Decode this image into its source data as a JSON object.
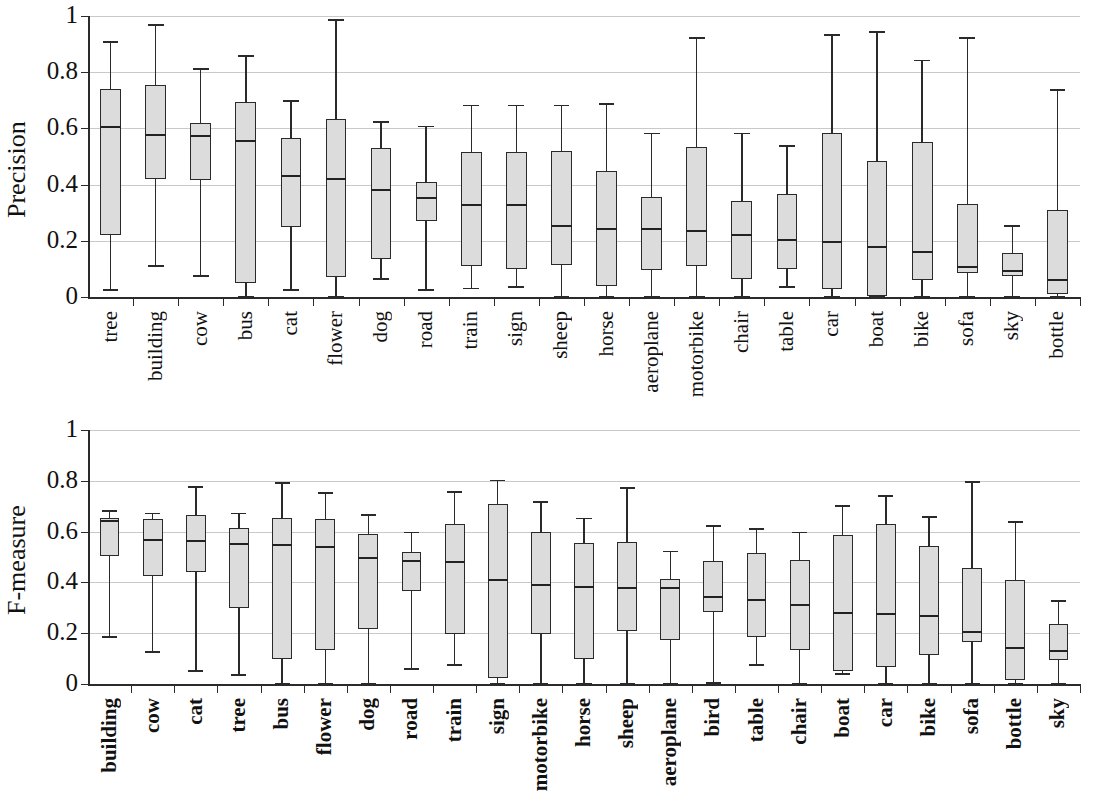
{
  "figure": {
    "background": "#ffffff",
    "box_fill": "#dcdcdc",
    "line_color": "#2a2a2a",
    "grid_color": "#c9c9c9"
  },
  "chart_data": [
    {
      "type": "box",
      "title": "",
      "ylabel": "Precision",
      "xlabel": "",
      "ylim": [
        0,
        1
      ],
      "yticks": [
        "0",
        "0.2",
        "0.4",
        "0.6",
        "0.8",
        "1"
      ],
      "ytick_values": [
        0,
        0.2,
        0.4,
        0.6,
        0.8,
        1
      ],
      "grid": "horizontal",
      "legend": "none",
      "categories": [
        "tree",
        "building",
        "cow",
        "bus",
        "cat",
        "flower",
        "dog",
        "road",
        "train",
        "sign",
        "sheep",
        "horse",
        "aeroplane",
        "motorbike",
        "chair",
        "table",
        "car",
        "boat",
        "bike",
        "sofa",
        "sky",
        "bottle"
      ],
      "boxes": [
        {
          "label": "tree",
          "min": 0.025,
          "q1": 0.22,
          "median": 0.61,
          "q3": 0.74,
          "max": 0.91
        },
        {
          "label": "building",
          "min": 0.11,
          "q1": 0.42,
          "median": 0.58,
          "q3": 0.755,
          "max": 0.97
        },
        {
          "label": "cow",
          "min": 0.075,
          "q1": 0.415,
          "median": 0.575,
          "q3": 0.62,
          "max": 0.815
        },
        {
          "label": "bus",
          "min": 0.0,
          "q1": 0.05,
          "median": 0.56,
          "q3": 0.695,
          "max": 0.86
        },
        {
          "label": "cat",
          "min": 0.025,
          "q1": 0.25,
          "median": 0.435,
          "q3": 0.565,
          "max": 0.7
        },
        {
          "label": "flower",
          "min": 0.0,
          "q1": 0.07,
          "median": 0.425,
          "q3": 0.635,
          "max": 0.99
        },
        {
          "label": "dog",
          "min": 0.065,
          "q1": 0.135,
          "median": 0.385,
          "q3": 0.53,
          "max": 0.625
        },
        {
          "label": "road",
          "min": 0.025,
          "q1": 0.27,
          "median": 0.355,
          "q3": 0.41,
          "max": 0.61
        },
        {
          "label": "train",
          "min": 0.03,
          "q1": 0.11,
          "median": 0.33,
          "q3": 0.515,
          "max": 0.685
        },
        {
          "label": "sign",
          "min": 0.035,
          "q1": 0.1,
          "median": 0.33,
          "q3": 0.515,
          "max": 0.685
        },
        {
          "label": "sheep",
          "min": 0.0,
          "q1": 0.115,
          "median": 0.255,
          "q3": 0.52,
          "max": 0.685
        },
        {
          "label": "horse",
          "min": 0.0,
          "q1": 0.04,
          "median": 0.245,
          "q3": 0.45,
          "max": 0.69
        },
        {
          "label": "aeroplane",
          "min": 0.0,
          "q1": 0.095,
          "median": 0.245,
          "q3": 0.355,
          "max": 0.585
        },
        {
          "label": "motorbike",
          "min": 0.0,
          "q1": 0.11,
          "median": 0.24,
          "q3": 0.535,
          "max": 0.925
        },
        {
          "label": "chair",
          "min": 0.0,
          "q1": 0.065,
          "median": 0.225,
          "q3": 0.34,
          "max": 0.585
        },
        {
          "label": "table",
          "min": 0.035,
          "q1": 0.1,
          "median": 0.205,
          "q3": 0.365,
          "max": 0.54
        },
        {
          "label": "car",
          "min": 0.0,
          "q1": 0.03,
          "median": 0.2,
          "q3": 0.585,
          "max": 0.935
        },
        {
          "label": "boat",
          "min": 0.0,
          "q1": 0.005,
          "median": 0.18,
          "q3": 0.485,
          "max": 0.945
        },
        {
          "label": "bike",
          "min": 0.0,
          "q1": 0.06,
          "median": 0.165,
          "q3": 0.55,
          "max": 0.845
        },
        {
          "label": "sofa",
          "min": 0.0,
          "q1": 0.085,
          "median": 0.11,
          "q3": 0.33,
          "max": 0.925
        },
        {
          "label": "sky",
          "min": 0.0,
          "q1": 0.075,
          "median": 0.095,
          "q3": 0.155,
          "max": 0.255
        },
        {
          "label": "bottle",
          "min": 0.0,
          "q1": 0.01,
          "median": 0.065,
          "q3": 0.31,
          "max": 0.74
        }
      ]
    },
    {
      "type": "box",
      "title": "",
      "ylabel": "F-measure",
      "xlabel": "",
      "ylim": [
        0,
        1
      ],
      "yticks": [
        "0",
        "0.2",
        "0.4",
        "0.6",
        "0.8",
        "1"
      ],
      "ytick_values": [
        0,
        0.2,
        0.4,
        0.6,
        0.8,
        1
      ],
      "grid": "horizontal",
      "legend": "none",
      "categories": [
        "building",
        "cow",
        "cat",
        "tree",
        "bus",
        "flower",
        "dog",
        "road",
        "train",
        "sign",
        "motorbike",
        "horse",
        "sheep",
        "aeroplane",
        "bird",
        "table",
        "chair",
        "boat",
        "car",
        "bike",
        "sofa",
        "bottle",
        "sky"
      ],
      "boxes": [
        {
          "label": "building",
          "min": 0.185,
          "q1": 0.505,
          "median": 0.645,
          "q3": 0.655,
          "max": 0.685
        },
        {
          "label": "cow",
          "min": 0.125,
          "q1": 0.425,
          "median": 0.57,
          "q3": 0.65,
          "max": 0.675
        },
        {
          "label": "cat",
          "min": 0.05,
          "q1": 0.44,
          "median": 0.565,
          "q3": 0.665,
          "max": 0.78
        },
        {
          "label": "tree",
          "min": 0.035,
          "q1": 0.3,
          "median": 0.555,
          "q3": 0.615,
          "max": 0.675
        },
        {
          "label": "bus",
          "min": 0.0,
          "q1": 0.1,
          "median": 0.55,
          "q3": 0.655,
          "max": 0.795
        },
        {
          "label": "flower",
          "min": 0.0,
          "q1": 0.135,
          "median": 0.545,
          "q3": 0.65,
          "max": 0.755
        },
        {
          "label": "dog",
          "min": 0.0,
          "q1": 0.215,
          "median": 0.5,
          "q3": 0.59,
          "max": 0.67
        },
        {
          "label": "road",
          "min": 0.06,
          "q1": 0.365,
          "median": 0.49,
          "q3": 0.52,
          "max": 0.6
        },
        {
          "label": "train",
          "min": 0.075,
          "q1": 0.195,
          "median": 0.485,
          "q3": 0.63,
          "max": 0.76
        },
        {
          "label": "sign",
          "min": 0.0,
          "q1": 0.025,
          "median": 0.415,
          "q3": 0.71,
          "max": 0.805
        },
        {
          "label": "motorbike",
          "min": 0.0,
          "q1": 0.195,
          "median": 0.395,
          "q3": 0.6,
          "max": 0.72
        },
        {
          "label": "horse",
          "min": 0.0,
          "q1": 0.1,
          "median": 0.385,
          "q3": 0.555,
          "max": 0.655
        },
        {
          "label": "sheep",
          "min": 0.0,
          "q1": 0.21,
          "median": 0.38,
          "q3": 0.56,
          "max": 0.775
        },
        {
          "label": "aeroplane",
          "min": 0.0,
          "q1": 0.175,
          "median": 0.38,
          "q3": 0.415,
          "max": 0.525
        },
        {
          "label": "bird",
          "min": 0.005,
          "q1": 0.285,
          "median": 0.345,
          "q3": 0.485,
          "max": 0.625
        },
        {
          "label": "table",
          "min": 0.075,
          "q1": 0.185,
          "median": 0.335,
          "q3": 0.515,
          "max": 0.615
        },
        {
          "label": "chair",
          "min": 0.0,
          "q1": 0.135,
          "median": 0.315,
          "q3": 0.49,
          "max": 0.6
        },
        {
          "label": "boat",
          "min": 0.04,
          "q1": 0.05,
          "median": 0.285,
          "q3": 0.585,
          "max": 0.705
        },
        {
          "label": "car",
          "min": 0.0,
          "q1": 0.065,
          "median": 0.28,
          "q3": 0.63,
          "max": 0.745
        },
        {
          "label": "bike",
          "min": 0.0,
          "q1": 0.115,
          "median": 0.27,
          "q3": 0.545,
          "max": 0.66
        },
        {
          "label": "sofa",
          "min": 0.0,
          "q1": 0.165,
          "median": 0.21,
          "q3": 0.455,
          "max": 0.8
        },
        {
          "label": "bottle",
          "min": 0.0,
          "q1": 0.015,
          "median": 0.145,
          "q3": 0.41,
          "max": 0.64
        },
        {
          "label": "sky",
          "min": 0.0,
          "q1": 0.095,
          "median": 0.135,
          "q3": 0.235,
          "max": 0.33
        }
      ]
    }
  ]
}
